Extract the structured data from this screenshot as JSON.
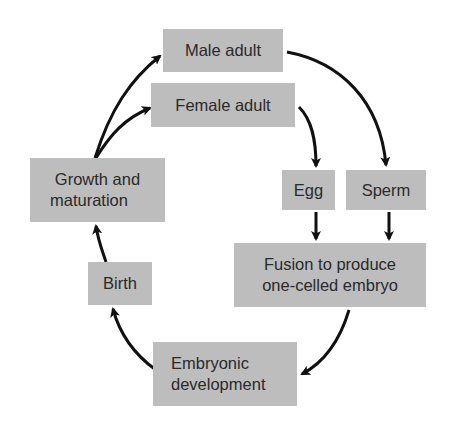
{
  "diagram": {
    "type": "life-cycle",
    "nodes": [
      {
        "id": "male_adult",
        "label": "Male adult"
      },
      {
        "id": "female_adult",
        "label": "Female adult"
      },
      {
        "id": "growth",
        "label_line1": "Growth and",
        "label_line2": "maturation"
      },
      {
        "id": "egg",
        "label": "Egg"
      },
      {
        "id": "sperm",
        "label": "Sperm"
      },
      {
        "id": "fusion",
        "label_line1": "Fusion to produce",
        "label_line2": "one-celled embryo"
      },
      {
        "id": "birth",
        "label": "Birth"
      },
      {
        "id": "embryonic",
        "label_line1": "Embryonic",
        "label_line2": "development"
      }
    ],
    "edges": [
      {
        "from": "growth",
        "to": "male_adult"
      },
      {
        "from": "growth",
        "to": "female_adult"
      },
      {
        "from": "male_adult",
        "to": "sperm"
      },
      {
        "from": "female_adult",
        "to": "egg"
      },
      {
        "from": "egg",
        "to": "fusion"
      },
      {
        "from": "sperm",
        "to": "fusion"
      },
      {
        "from": "fusion",
        "to": "embryonic"
      },
      {
        "from": "embryonic",
        "to": "birth"
      },
      {
        "from": "birth",
        "to": "growth"
      }
    ],
    "colors": {
      "box_fill": "#bdbdbd",
      "text": "#2a2a2a",
      "arrow": "#111111"
    }
  }
}
